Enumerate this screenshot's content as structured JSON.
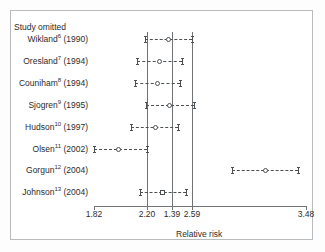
{
  "figure": {
    "header_label": "Study omitted",
    "axis_title": "Relative risk"
  },
  "chart_data": {
    "type": "scatter",
    "subtype": "forest-plot",
    "title": "",
    "xlabel": "Relative risk",
    "ylabel": "Study omitted",
    "xlim": [
      1.82,
      3.48
    ],
    "grid": false,
    "legend": null,
    "axis_ticks": [
      {
        "label": "1.82",
        "value": 1.82
      },
      {
        "label": "2.20",
        "value": 2.2
      },
      {
        "label": "1.39",
        "value": 1.39
      },
      {
        "label": "2.59",
        "value": 2.59
      },
      {
        "label": "3.48",
        "value": 3.48
      }
    ],
    "reference_lines": [
      {
        "label": "2.20",
        "px": 147
      },
      {
        "label": "1.39",
        "px": 172
      },
      {
        "label": "2.59",
        "px": 192
      }
    ],
    "categories": [
      "Wikland (1990)",
      "Oresland (1994)",
      "Couniham (1994)",
      "Sjogren (1995)",
      "Hudson (1997)",
      "Olsen (2002)",
      "Gorgun (2004)",
      "Johnson (2004)"
    ],
    "rows": [
      {
        "author": "Wikland",
        "ref": "6",
        "year": "(1990)",
        "marker": "circle",
        "estimate": 2.4,
        "ci_low": 2.22,
        "ci_high": 2.59,
        "px": {
          "low": 145,
          "point": 168,
          "high": 192
        }
      },
      {
        "author": "Oresland",
        "ref": "7",
        "year": "(1994)",
        "marker": "circle",
        "estimate": 2.33,
        "ci_low": 2.15,
        "ci_high": 2.51,
        "px": {
          "low": 137,
          "point": 159,
          "high": 182
        }
      },
      {
        "author": "Couniham",
        "ref": "8",
        "year": "(1994)",
        "marker": "circle",
        "estimate": 2.31,
        "ci_low": 2.14,
        "ci_high": 2.49,
        "px": {
          "low": 135,
          "point": 157,
          "high": 180
        }
      },
      {
        "author": "Sjogren",
        "ref": "9",
        "year": "(1995)",
        "marker": "circle",
        "estimate": 2.41,
        "ci_low": 2.23,
        "ci_high": 2.6,
        "px": {
          "low": 146,
          "point": 169,
          "high": 194
        }
      },
      {
        "author": "Hudson",
        "ref": "10",
        "year": "(1997)",
        "marker": "circle",
        "estimate": 2.3,
        "ci_low": 2.11,
        "ci_high": 2.48,
        "px": {
          "low": 131,
          "point": 155,
          "high": 178
        }
      },
      {
        "author": "Olsen",
        "ref": "11",
        "year": "(2002)",
        "marker": "circle",
        "estimate": 2.01,
        "ci_low": 1.82,
        "ci_high": 2.23,
        "px": {
          "low": 94,
          "point": 118,
          "high": 147
        }
      },
      {
        "author": "Gorgun",
        "ref": "12",
        "year": "(2004)",
        "marker": "circle",
        "estimate": 3.16,
        "ci_low": 2.9,
        "ci_high": 3.42,
        "px": {
          "low": 232,
          "point": 265,
          "high": 298
        }
      },
      {
        "author": "Johnson",
        "ref": "13",
        "year": "(2004)",
        "marker": "square",
        "estimate": 2.35,
        "ci_low": 2.18,
        "ci_high": 2.54,
        "px": {
          "low": 140,
          "point": 162,
          "high": 186
        }
      }
    ]
  },
  "geometry": {
    "label_right_px": 92,
    "header_y": 22,
    "row_y": [
      39,
      61,
      83,
      105,
      127,
      149,
      170,
      192
    ],
    "axis_y": 206,
    "axis_left_px": 94,
    "axis_right_px": 306,
    "vline_top": 32,
    "vline_bottom": 206,
    "tick_label_y": 209,
    "axis_title_y": 229
  },
  "colors": {
    "ink": "#2b2b2b",
    "rule": "#6f7376",
    "glyph": "#4c5052",
    "border": "#b9bcbe",
    "paper": "#ffffff",
    "page": "#fdfdfd"
  }
}
